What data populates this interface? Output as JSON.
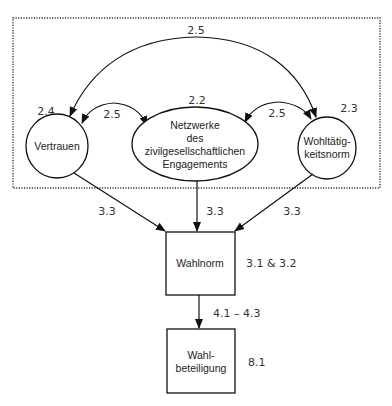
{
  "diagram": {
    "title": "",
    "group_box": {
      "style": "dotted"
    },
    "nodes": {
      "vertrauen": {
        "label": "Vertrauen",
        "shape": "circle",
        "section": "2.4"
      },
      "netzwerke": {
        "label_lines": [
          "Netzwerke",
          "des",
          "zivilgesellschaftlichen",
          "Engagements"
        ],
        "shape": "ellipse",
        "section": "2.2"
      },
      "wohltaetigkeit": {
        "label_lines": [
          "Wohltätig-",
          "keitsnorm"
        ],
        "shape": "circle",
        "section": "2.3"
      },
      "wahlnorm": {
        "label": "Wahlnorm",
        "shape": "rectangle",
        "section": "3.1 & 3.2"
      },
      "wahlbeteiligung": {
        "label_lines": [
          "Wahl-",
          "beteiligung"
        ],
        "shape": "rectangle",
        "section": "8.1"
      }
    },
    "edges": {
      "vertrauen_wohltaetigkeit": {
        "label": "2.5",
        "type": "bidirectional-arc"
      },
      "vertrauen_netzwerke": {
        "label": "2.5",
        "type": "bidirectional-arc"
      },
      "netzwerke_wohltaetigkeit": {
        "label": "2.5",
        "type": "bidirectional-arc"
      },
      "vertrauen_wahlnorm": {
        "label": "3.3",
        "type": "arrow"
      },
      "netzwerke_wahlnorm": {
        "label": "3.3",
        "type": "arrow"
      },
      "wohltaetigkeit_wahlnorm": {
        "label": "3.3",
        "type": "arrow"
      },
      "wahlnorm_wahlbeteiligung": {
        "label": "4.1 – 4.3",
        "type": "arrow"
      }
    },
    "colors": {
      "stroke": "#111111",
      "text": "#222222",
      "background": "#ffffff"
    }
  }
}
